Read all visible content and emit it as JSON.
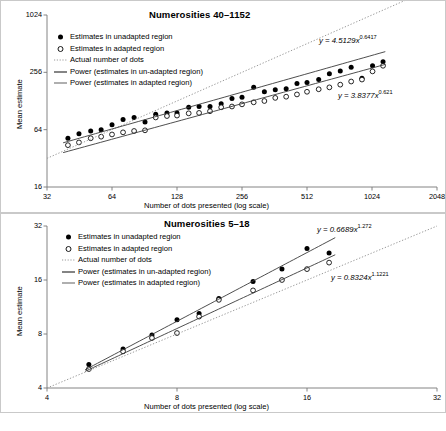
{
  "figure": {
    "background": "#ffffff",
    "series_colors": {
      "unadapted": "#000000",
      "adapted": "#ffffff",
      "stroke": "#000000",
      "identity": "#9a9a9a",
      "fit": "#3a3a3a"
    }
  },
  "panels": [
    {
      "id": "top",
      "title": "Numerosities 40–1152",
      "legend": [
        {
          "marker": "filled-circle",
          "label": "Estimates in unadapted region"
        },
        {
          "marker": "open-circle",
          "label": "Estimates in adapted region"
        },
        {
          "marker": "dotted-line",
          "label": "Actual number of dots"
        },
        {
          "marker": "solid-line",
          "label": "Power (estimates in un-adapted region)"
        },
        {
          "marker": "solid-line",
          "label": "Power (estimates in adapted region)"
        }
      ],
      "equations": [
        {
          "text": "y = 4.5129x",
          "exponent": "0.6417",
          "for": "unadapted"
        },
        {
          "text": "y = 3.8377x",
          "exponent": "0.621",
          "for": "adapted"
        }
      ],
      "chart_data": {
        "type": "scatter",
        "title": "Numerosities 40–1152",
        "xlabel": "Number of dots presented (log scale)",
        "ylabel": "Mean estimate",
        "xscale": "log2",
        "yscale": "log2",
        "xlim": [
          32,
          2048
        ],
        "ylim": [
          16,
          1024
        ],
        "xticks": [
          32,
          64,
          128,
          256,
          512,
          1024,
          2048
        ],
        "yticks": [
          16,
          64,
          256,
          1024
        ],
        "grid": false,
        "legend_position": "upper-left",
        "series": [
          {
            "name": "Estimates in unadapted region",
            "marker": "filled-circle",
            "x": [
              40,
              45,
              51,
              57,
              64,
              72,
              81,
              91,
              102,
              115,
              128,
              145,
              162,
              182,
              205,
              230,
              256,
              290,
              325,
              365,
              410,
              460,
              512,
              580,
              650,
              730,
              820,
              920,
              1030,
              1152
            ],
            "y": [
              52,
              58,
              62,
              64,
              72,
              82,
              86,
              77,
              93,
              96,
              96,
              110,
              112,
              112,
              120,
              136,
              140,
              178,
              160,
              168,
              172,
              196,
              200,
              215,
              248,
              265,
              290,
              222,
              300,
              330
            ]
          },
          {
            "name": "Estimates in adapted region",
            "marker": "open-circle",
            "x": [
              40,
              45,
              51,
              57,
              64,
              72,
              81,
              91,
              102,
              115,
              128,
              145,
              162,
              182,
              205,
              230,
              256,
              290,
              325,
              365,
              410,
              460,
              512,
              580,
              650,
              730,
              820,
              920,
              1030,
              1152
            ],
            "y": [
              44,
              47,
              52,
              54,
              57,
              60,
              62,
              63,
              86,
              89,
              90,
              95,
              96,
              100,
              110,
              112,
              118,
              124,
              128,
              138,
              142,
              150,
              160,
              170,
              178,
              190,
              205,
              215,
              262,
              300
            ]
          },
          {
            "name": "Actual number of dots",
            "marker": "dotted-line",
            "type": "identity",
            "x": [
              32,
              2048
            ],
            "y": [
              32,
              2048
            ]
          },
          {
            "name": "Power (estimates in un-adapted region)",
            "marker": "solid-line",
            "type": "power",
            "a": 4.5129,
            "b": 0.6417,
            "xrange": [
              38,
              1180
            ]
          },
          {
            "name": "Power (estimates in adapted region)",
            "marker": "solid-line",
            "type": "power",
            "a": 3.8377,
            "b": 0.621,
            "xrange": [
              38,
              1180
            ]
          }
        ]
      }
    },
    {
      "id": "bottom",
      "title": "Numerosities 5–18",
      "legend": [
        {
          "marker": "filled-circle",
          "label": "Estimates in unadapted region"
        },
        {
          "marker": "open-circle",
          "label": "Estimates in adapted region"
        },
        {
          "marker": "dotted-line",
          "label": "Actual number of dots"
        },
        {
          "marker": "solid-line",
          "label": "Power (estimates in un-adapted region)"
        },
        {
          "marker": "solid-line",
          "label": "Power (estimates in adapted region)"
        }
      ],
      "equations": [
        {
          "text": "y = 0.6689x",
          "exponent": "1.272",
          "for": "unadapted"
        },
        {
          "text": "y = 0.8324x",
          "exponent": "1.1221",
          "for": "adapted"
        }
      ],
      "chart_data": {
        "type": "scatter",
        "title": "Numerosities 5–18",
        "xlabel": "Number of dots presented (log scale)",
        "ylabel": "Mean estimate",
        "xscale": "log2",
        "yscale": "log2",
        "xlim": [
          4,
          32
        ],
        "ylim": [
          4,
          32
        ],
        "xticks": [
          4,
          8,
          16,
          32
        ],
        "yticks": [
          4,
          8,
          16,
          32
        ],
        "grid": false,
        "legend_position": "upper-left",
        "series": [
          {
            "name": "Estimates in unadapted region",
            "marker": "filled-circle",
            "x": [
              5,
              6,
              7,
              8,
              9,
              10,
              12,
              14,
              16,
              18
            ],
            "y": [
              5.4,
              6.6,
              7.9,
              9.6,
              10.4,
              12.6,
              15.7,
              18.4,
              24.0,
              22.6
            ]
          },
          {
            "name": "Estimates in adapted region",
            "marker": "open-circle",
            "x": [
              5,
              6,
              7,
              8,
              9,
              10,
              12,
              14,
              16,
              18
            ],
            "y": [
              5.1,
              6.4,
              7.6,
              8.1,
              10.0,
              12.4,
              14.0,
              16.0,
              18.4,
              20.0
            ]
          },
          {
            "name": "Actual number of dots",
            "marker": "dotted-line",
            "type": "identity",
            "x": [
              4,
              32
            ],
            "y": [
              4,
              32
            ]
          },
          {
            "name": "Power (estimates in un-adapted region)",
            "marker": "solid-line",
            "type": "power",
            "a": 0.6689,
            "b": 1.272,
            "xrange": [
              4.9,
              18.6
            ]
          },
          {
            "name": "Power (estimates in adapted region)",
            "marker": "solid-line",
            "type": "power",
            "a": 0.8324,
            "b": 1.1221,
            "xrange": [
              4.9,
              18.6
            ]
          }
        ]
      }
    }
  ]
}
